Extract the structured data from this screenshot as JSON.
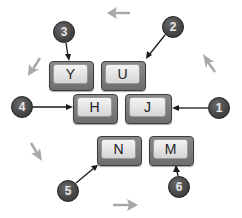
{
  "diagram": {
    "keys": [
      {
        "label": "Y",
        "x": 49,
        "y": 61,
        "w": 45,
        "h": 30
      },
      {
        "label": "U",
        "x": 101,
        "y": 61,
        "w": 45,
        "h": 30
      },
      {
        "label": "H",
        "x": 73,
        "y": 94,
        "w": 45,
        "h": 30
      },
      {
        "label": "J",
        "x": 125,
        "y": 94,
        "w": 47,
        "h": 30
      },
      {
        "label": "N",
        "x": 97,
        "y": 136,
        "w": 45,
        "h": 30
      },
      {
        "label": "M",
        "x": 149,
        "y": 136,
        "w": 45,
        "h": 30
      }
    ],
    "callouts": [
      {
        "number": "1",
        "cx": 219,
        "cy": 108,
        "target": "J"
      },
      {
        "number": "2",
        "cx": 173,
        "cy": 27,
        "target": "U"
      },
      {
        "number": "3",
        "cx": 64,
        "cy": 32,
        "target": "Y"
      },
      {
        "number": "4",
        "cx": 22,
        "cy": 107,
        "target": "H"
      },
      {
        "number": "5",
        "cx": 68,
        "cy": 191,
        "target": "N"
      },
      {
        "number": "6",
        "cx": 179,
        "cy": 187,
        "target": "M"
      }
    ],
    "direction_arrows": [
      {
        "name": "up-arrow-hint",
        "direction": "left",
        "position": "top"
      },
      {
        "name": "up-right-arrow-hint",
        "direction": "up-left",
        "position": "right"
      },
      {
        "name": "left-arrow-hint",
        "direction": "down-left",
        "position": "upper-left"
      },
      {
        "name": "down-left-arrow-hint",
        "direction": "down-right",
        "position": "lower-left"
      },
      {
        "name": "down-arrow-hint",
        "direction": "right",
        "position": "bottom"
      }
    ],
    "colors": {
      "badge_fill": "#454545",
      "badge_text": "#e8e8e8",
      "leader_line": "#1a1a1a",
      "hint_arrow": "#a8a8a8",
      "key_face": "#ececec",
      "key_edge": "#6e6e6e"
    }
  }
}
